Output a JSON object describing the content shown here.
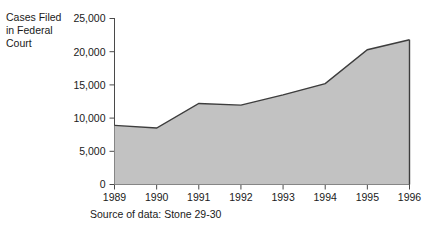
{
  "figure": {
    "y_axis_title": "Cases Filed\nin Federal\nCourt",
    "source_caption": "Source of data: Stone 29-30"
  },
  "style": {
    "area_fill": "#c2c2c2",
    "line_color": "#3d3d3d",
    "axis_color": "#4a4a4a",
    "text_color": "#1a1a1a",
    "background": "#ffffff"
  },
  "chart_data": {
    "type": "area",
    "title": "",
    "subtitle": "",
    "xlabel": "",
    "ylabel": "Cases Filed in Federal Court",
    "categories": [
      "1989",
      "1990",
      "1991",
      "1992",
      "1993",
      "1994",
      "1995",
      "1996"
    ],
    "x": [
      1989,
      1990,
      1991,
      1992,
      1993,
      1994,
      1995,
      1996
    ],
    "values": [
      8900,
      8500,
      12200,
      11950,
      13500,
      15200,
      20300,
      21800
    ],
    "series": [
      {
        "name": "Cases Filed in Federal Court",
        "values": [
          8900,
          8500,
          12200,
          11950,
          13500,
          15200,
          20300,
          21800
        ]
      }
    ],
    "xlim": [
      1989,
      1996
    ],
    "ylim": [
      0,
      25000
    ],
    "ytick_values": [
      0,
      5000,
      10000,
      15000,
      20000,
      25000
    ],
    "ytick_labels": [
      "0",
      "5,000",
      "10,000",
      "15,000",
      "20,000",
      "25,000"
    ],
    "xtick_labels": [
      "1989",
      "1990",
      "1991",
      "1992",
      "1993",
      "1994",
      "1995",
      "1996"
    ],
    "grid": false,
    "legend": false,
    "legend_position": "none",
    "annotations": [
      "Source of data: Stone 29-30"
    ]
  }
}
